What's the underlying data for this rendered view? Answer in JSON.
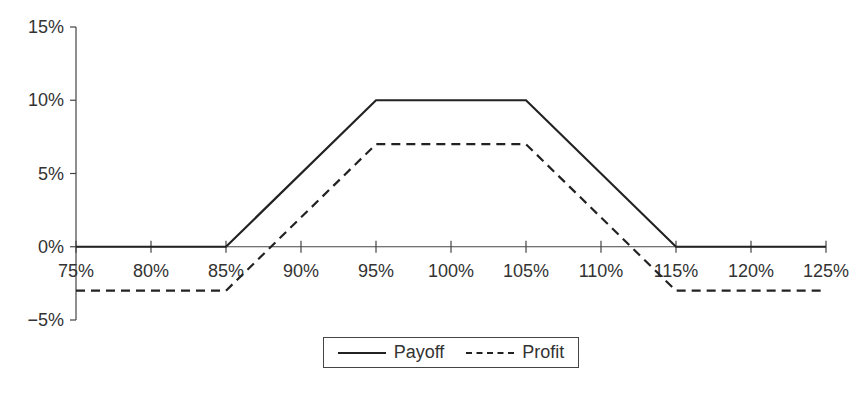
{
  "chart_data": {
    "type": "line",
    "title": "",
    "xlabel": "",
    "ylabel": "",
    "x": [
      75,
      80,
      85,
      90,
      95,
      100,
      105,
      110,
      115,
      120,
      125
    ],
    "x_tick_labels": [
      "75%",
      "80%",
      "85%",
      "90%",
      "95%",
      "100%",
      "105%",
      "110%",
      "115%",
      "120%",
      "125%"
    ],
    "y_tick_labels": [
      "15%",
      "10%",
      "5%",
      "0%",
      "−5%"
    ],
    "y_ticks": [
      15,
      10,
      5,
      0,
      -5
    ],
    "xlim": [
      75,
      125
    ],
    "ylim": [
      -5,
      15
    ],
    "grid": false,
    "legend_position": "bottom",
    "series": [
      {
        "name": "Payoff",
        "style": "solid",
        "points": [
          [
            75,
            0
          ],
          [
            85,
            0
          ],
          [
            95,
            10
          ],
          [
            105,
            10
          ],
          [
            115,
            0
          ],
          [
            125,
            0
          ]
        ],
        "values": [
          0,
          0,
          0,
          5,
          10,
          10,
          10,
          5,
          0,
          0,
          0
        ]
      },
      {
        "name": "Profit",
        "style": "dashed",
        "points": [
          [
            75,
            -3
          ],
          [
            85,
            -3
          ],
          [
            95,
            7
          ],
          [
            105,
            7
          ],
          [
            115,
            -3
          ],
          [
            125,
            -3
          ]
        ],
        "values": [
          -3,
          -3,
          -3,
          2,
          7,
          7,
          7,
          2,
          -3,
          -3,
          -3
        ]
      }
    ]
  },
  "legend": {
    "payoff_label": "Payoff",
    "profit_label": "Profit"
  }
}
